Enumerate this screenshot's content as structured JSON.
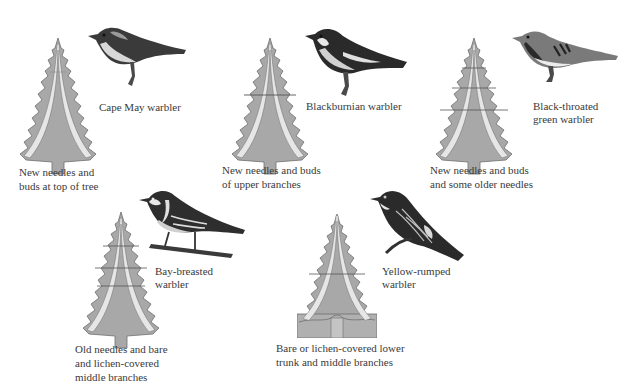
{
  "figure": {
    "colors": {
      "tree_fill": "#a8a8a8",
      "tree_outline": "#6e6e6e",
      "band": "#e6e6e6",
      "zone_line": "#555555",
      "trunk": "#b5b5b5",
      "bird_dark": "#2a2a2a",
      "bird_mid": "#7a7a7a",
      "bird_light": "#e8e8e8",
      "text": "#3a3a3a"
    },
    "panels": [
      {
        "bird": "Cape May warbler",
        "caption_lines": [
          "New needles and",
          "buds at top of tree"
        ],
        "feeding_zone": "top of tree"
      },
      {
        "bird": "Blackburnian warbler",
        "caption_lines": [
          "New needles and buds",
          "of upper branches"
        ],
        "feeding_zone": "upper branches"
      },
      {
        "bird_lines": [
          "Black-throated",
          "green warbler"
        ],
        "caption_lines": [
          "New needles and buds",
          "and some older needles"
        ],
        "feeding_zone": "upper-middle outer branches"
      },
      {
        "bird_lines": [
          "Bay-breasted",
          "warbler"
        ],
        "caption_lines": [
          "Old needles and bare",
          "and lichen-covered",
          "middle branches"
        ],
        "feeding_zone": "middle branches"
      },
      {
        "bird_lines": [
          "Yellow-rumped",
          "warbler"
        ],
        "caption_lines": [
          "Bare or lichen-covered lower",
          "trunk and middle branches"
        ],
        "feeding_zone": "lower trunk and middle branches"
      }
    ]
  }
}
